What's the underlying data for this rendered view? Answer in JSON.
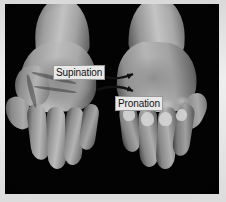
{
  "figure": {
    "type": "anatomy-photograph",
    "background_color": "#030303",
    "frame_color": "#dcdcdc",
    "width": 226,
    "height": 202
  },
  "annotations": {
    "supination": {
      "label": "Supination",
      "arrow_direction": "left",
      "text_color": "#111111",
      "box_color": "#e8e8e8"
    },
    "pronation": {
      "label": "Pronation",
      "arrow_direction": "right",
      "text_color": "#111111",
      "box_color": "#e8e8e8"
    }
  },
  "hands": {
    "left": {
      "name": "left-hand-supinated",
      "description": "palm facing up"
    },
    "right": {
      "name": "right-hand-pronated",
      "description": "back of hand facing up"
    }
  }
}
